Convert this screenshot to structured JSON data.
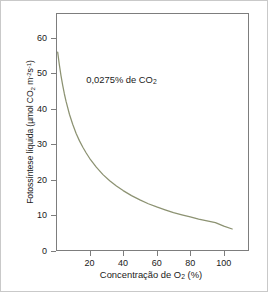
{
  "chart_data": {
    "type": "line",
    "title": "",
    "xlabel": "Concentração de O₂ (%)",
    "ylabel": "Fotossíntese líquida (µmol CO₂ m⁻²s⁻¹)",
    "xlim": [
      0,
      115
    ],
    "ylim": [
      0,
      67
    ],
    "grid": false,
    "legend_position": "none",
    "xticks": [
      20,
      40,
      60,
      80,
      100
    ],
    "yticks": [
      0,
      10,
      20,
      30,
      40,
      50,
      60
    ],
    "annotations": [
      {
        "text": "0,0275% de CO₂",
        "x": 18,
        "y": 48
      }
    ],
    "series": [
      {
        "name": "0,0275% de CO₂",
        "color": "#8c9272",
        "x": [
          1,
          2,
          3,
          4,
          5,
          6,
          8,
          10,
          12,
          14,
          16,
          18,
          20,
          24,
          28,
          32,
          36,
          40,
          45,
          50,
          55,
          60,
          65,
          70,
          75,
          80,
          85,
          90,
          95,
          100,
          105
        ],
        "y": [
          56.0,
          52.4,
          49.3,
          46.6,
          44.2,
          42.1,
          38.5,
          35.6,
          33.1,
          31.0,
          29.2,
          27.6,
          26.1,
          23.6,
          21.5,
          19.8,
          18.3,
          17.0,
          15.6,
          14.4,
          13.3,
          12.4,
          11.6,
          10.8,
          10.2,
          9.6,
          9.0,
          8.5,
          8.0,
          7.0,
          6.2
        ]
      }
    ]
  },
  "axes": {
    "y_title_main": "Fotossíntese líquida (µmol CO",
    "y_title_sub1": "2",
    "y_title_mid": " m",
    "y_title_sup1": "-2",
    "y_title_s": "s",
    "y_title_sup2": "-1",
    "y_title_close": ")",
    "x_title_main": "Concentração de O",
    "x_title_sub": "2",
    "x_title_tail": " (%)",
    "ytick_labels": [
      "60",
      "50",
      "40",
      "30",
      "20",
      "10",
      "0"
    ],
    "xtick_labels": [
      "20",
      "40",
      "60",
      "80",
      "100"
    ]
  },
  "annotation": {
    "main": "0,0275% de CO",
    "sub": "2"
  },
  "colors": {
    "curve": "#8c9272",
    "frame": "#7d7d7d",
    "text": "#1a1a1a",
    "outer_border": "#c9c9c9",
    "background": "#ffffff"
  }
}
